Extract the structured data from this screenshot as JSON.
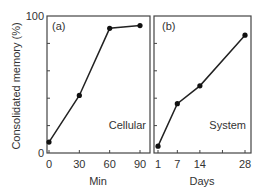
{
  "figure": {
    "ylabel": "Consolidated memory (%)",
    "y_tick_top": "100",
    "y_tick_bottom": "0"
  },
  "chart_data": [
    {
      "type": "line",
      "panel": "(a)",
      "annotation": "Cellular",
      "xlabel": "Min",
      "ylabel": "Consolidated memory (%)",
      "x": [
        0,
        30,
        60,
        90
      ],
      "x_tick_labels": [
        "0",
        "30",
        "60",
        "90"
      ],
      "values": [
        8,
        42,
        91,
        93
      ],
      "ylim": [
        0,
        100
      ],
      "xlim": [
        0,
        90
      ],
      "grid": false
    },
    {
      "type": "line",
      "panel": "(b)",
      "annotation": "System",
      "xlabel": "Days",
      "ylabel": "Consolidated memory (%)",
      "x": [
        1,
        7,
        14,
        28
      ],
      "x_tick_labels": [
        "1",
        "7",
        "14",
        "28"
      ],
      "values": [
        5,
        36,
        49,
        86
      ],
      "ylim": [
        0,
        100
      ],
      "xlim": [
        1,
        28
      ],
      "grid": false
    }
  ]
}
